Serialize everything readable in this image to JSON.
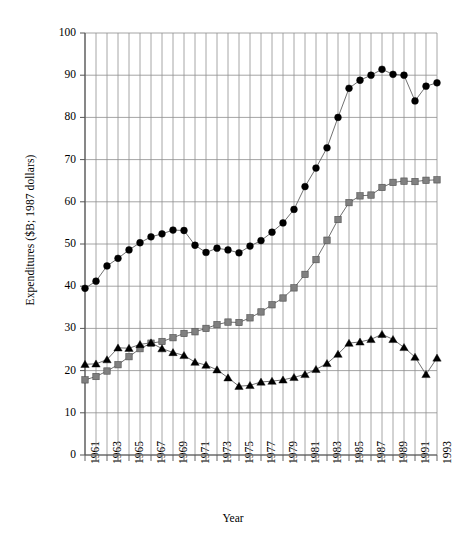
{
  "chart_data": {
    "type": "line",
    "title": "",
    "xlabel": "Year",
    "ylabel": "Expenditures ($B; 1987 dollars)",
    "xlim": [
      1961,
      1993
    ],
    "ylim": [
      0,
      100
    ],
    "ytick_step": 10,
    "grid": true,
    "legend": "none",
    "x": [
      1961,
      1962,
      1963,
      1964,
      1965,
      1966,
      1967,
      1968,
      1969,
      1970,
      1971,
      1972,
      1973,
      1974,
      1975,
      1976,
      1977,
      1978,
      1979,
      1980,
      1981,
      1982,
      1983,
      1984,
      1985,
      1986,
      1987,
      1988,
      1989,
      1990,
      1991,
      1992,
      1993
    ],
    "ytick_labels": [
      "0",
      "10",
      "20",
      "30",
      "40",
      "50",
      "60",
      "70",
      "80",
      "90",
      "100"
    ],
    "xtick_labels": [
      "1961",
      "1963",
      "1965",
      "1967",
      "1969",
      "1971",
      "1973",
      "1975",
      "1977",
      "1979",
      "1981",
      "1983",
      "1985",
      "1987",
      "1989",
      "1991",
      "1993"
    ],
    "series": [
      {
        "name": "total",
        "marker": "circle",
        "color": "#000000",
        "values": [
          39.5,
          41.2,
          44.8,
          46.6,
          48.6,
          50.3,
          51.7,
          52.4,
          53.3,
          53.2,
          49.7,
          48.0,
          49.0,
          48.6,
          47.9,
          49.5,
          50.8,
          52.8,
          55.0,
          58.2,
          63.6,
          68.0,
          72.8,
          80.0,
          86.9,
          88.8,
          90.0,
          91.4,
          90.2,
          90.0,
          83.9,
          87.4,
          88.2
        ]
      },
      {
        "name": "middle",
        "marker": "square",
        "color": "#808080",
        "values": [
          17.8,
          18.6,
          19.9,
          21.4,
          23.3,
          25.2,
          26.5,
          26.9,
          27.8,
          28.8,
          29.2,
          30.0,
          30.9,
          31.5,
          31.4,
          32.5,
          33.9,
          35.6,
          37.2,
          39.6,
          42.8,
          46.3,
          50.9,
          55.8,
          59.8,
          61.4,
          61.6,
          63.4,
          64.6,
          64.9,
          64.8,
          65.1,
          65.2
        ]
      },
      {
        "name": "lower",
        "marker": "triangle",
        "color": "#000000",
        "values": [
          21.5,
          21.6,
          22.6,
          25.4,
          25.3,
          26.2,
          26.6,
          25.2,
          24.3,
          23.6,
          22.0,
          21.3,
          20.2,
          18.3,
          16.3,
          16.5,
          17.3,
          17.5,
          17.8,
          18.4,
          19.1,
          20.3,
          21.7,
          23.9,
          26.5,
          26.8,
          27.4,
          28.6,
          27.4,
          25.5,
          23.2,
          19.1,
          23.0
        ]
      }
    ]
  }
}
